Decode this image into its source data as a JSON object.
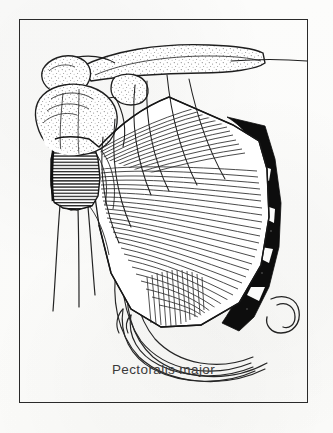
{
  "figure": {
    "caption": "Pectoralis major",
    "frame": {
      "x": 19,
      "y": 19,
      "width": 289,
      "height": 384,
      "stroke": "#2a2a2a",
      "stroke_width": 1.5
    },
    "background_color": "#fdfdfc",
    "ink_color": "#1c1c1c",
    "shading": {
      "bone_stipple": "#8a8a8a",
      "muscle_hatch": "#2b2b2b",
      "sternum_fill": "#0d0d0d"
    },
    "view": "anterior",
    "side": "right",
    "technique": "pen-and-ink line drawing with hatching and stipple",
    "labels": [
      {
        "text": "Pectoralis major",
        "x": 175,
        "y": 372,
        "anchor": "middle",
        "font_size": 13.5
      }
    ],
    "structures": [
      {
        "name": "clavicle",
        "kind": "bone",
        "style": "outline-with-stipple",
        "note": "runs from upper-left acromial end to upper-right sternal end"
      },
      {
        "name": "acromion",
        "kind": "bone",
        "style": "outline-with-stipple",
        "note": "upper-left lobed process"
      },
      {
        "name": "coracoid-process",
        "kind": "bone",
        "style": "outline-with-stipple"
      },
      {
        "name": "humeral-head",
        "kind": "bone",
        "style": "outline-with-stipple",
        "note": "rounded head at left with greater tubercle"
      },
      {
        "name": "humerus-shaft",
        "kind": "bone",
        "style": "long-thin-outline",
        "note": "two long descending lines at lower-left"
      },
      {
        "name": "pectoralis-major-muscle",
        "kind": "muscle",
        "style": "fan-shaped-fiber-hatching",
        "note": "fibers converge to a narrow tendon inserting on the humerus and fan out to clavicle, sternum and ribs"
      },
      {
        "name": "pectoralis-insertion-tendon",
        "kind": "tendon",
        "style": "dense-horizontal-hatching",
        "note": "narrow flat tendon at left on humerus"
      },
      {
        "name": "sternum-and-costal-cartilage",
        "kind": "bone",
        "style": "solid-black-fill",
        "note": "dark vertical band along the right margin"
      },
      {
        "name": "rib-cage",
        "kind": "bone",
        "style": "nested-curved-outlines",
        "note": "ribs and intercostal bands visible beneath and below the muscle"
      },
      {
        "name": "costal-margin",
        "kind": "bone",
        "style": "nested-curved-outlines",
        "note": "lower arching rib outlines below muscle"
      },
      {
        "name": "xiphoid-hook",
        "kind": "bone",
        "style": "small-hooked-curve",
        "note": "small hook shape lower-right"
      },
      {
        "name": "clavicle-trace-line",
        "kind": "guide-line",
        "style": "thin-horizontal-line",
        "note": "thin line extending right from the sternal end of the clavicle"
      }
    ]
  }
}
